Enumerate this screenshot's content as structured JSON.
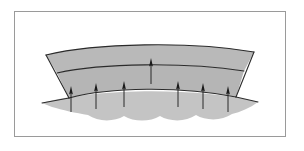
{
  "figure": {
    "domain": "Diagram",
    "kind": "geologic-cross-section",
    "title": "",
    "caption": "",
    "background_color": "#ffffff",
    "frame": {
      "x": 14,
      "y": 11,
      "width": 272,
      "height": 126,
      "stroke_color": "#9a9a9a",
      "stroke_width": 1,
      "fill": "#ffffff"
    },
    "palette": {
      "upper_layer_fill": "#b9b9b9",
      "middle_layer_fill": "#b5b5b5",
      "basement_fill": "#c4c4c4",
      "outline": "#2b2b2b",
      "arrow_color": "#1a1a1a",
      "frame_stroke": "#9a9a9a"
    },
    "layers": [
      {
        "name": "upper-bed",
        "label": "",
        "fill": "#b9b9b9",
        "path": "M 46 55 C 95 43, 190 41, 254 52 L 244 71 C 185 62, 102 63, 57 73 Z"
      },
      {
        "name": "middle-bed",
        "label": "",
        "fill": "#b5b5b5",
        "path": "M 57 73 C 102 63, 185 62, 244 71 L 236 97 C 180 86, 110 87, 69 98 Z"
      },
      {
        "name": "basement-wavy",
        "label": "",
        "fill": "#c4c4c4",
        "path": "M 42 103 C 95 88, 200 87, 258 102 C 250 108, 240 112, 232 114 C 222 121, 206 121, 196 115 C 186 122, 170 122, 160 116 C 150 122, 134 122, 124 116 C 114 122, 98 122, 88 115 C 76 113, 62 110, 52 107 Z"
      }
    ],
    "boundaries": [
      {
        "name": "top-surface",
        "path": "M 46 55 C 95 43, 190 41, 254 52"
      },
      {
        "name": "upper-middle-contact",
        "path": "M 57 73 C 102 63, 185 62, 244 71"
      },
      {
        "name": "middle-basement-contact",
        "path": "M 69 98 C 110 87, 180 86, 236 97"
      },
      {
        "name": "left-flank",
        "path": "M 46 55 L 69 98"
      },
      {
        "name": "right-flank",
        "path": "M 254 52 L 236 97"
      },
      {
        "name": "basement-top-left",
        "path": "M 42 103 L 69 98"
      },
      {
        "name": "basement-top-right",
        "path": "M 236 97 L 258 102"
      }
    ],
    "arrows": {
      "direction": "up",
      "color": "#1a1a1a",
      "meaning": "uplift-force",
      "head_rows": [
        {
          "row_name": "upper-contact-arrow-row",
          "items": [
            {
              "name": "arrow-center-upper",
              "x": 151,
              "head_y": 62,
              "tail_y": 84
            }
          ]
        },
        {
          "row_name": "basement-contact-arrow-row",
          "items": [
            {
              "name": "arrow-1",
              "x": 71,
              "head_y": 90,
              "tail_y": 112
            },
            {
              "name": "arrow-2",
              "x": 96,
              "head_y": 87,
              "tail_y": 109
            },
            {
              "name": "arrow-3",
              "x": 124,
              "head_y": 85,
              "tail_y": 107
            },
            {
              "name": "arrow-4",
              "x": 178,
              "head_y": 85,
              "tail_y": 107
            },
            {
              "name": "arrow-5",
              "x": 203,
              "head_y": 87,
              "tail_y": 109
            },
            {
              "name": "arrow-6",
              "x": 228,
              "head_y": 90,
              "tail_y": 112
            }
          ]
        }
      ]
    }
  }
}
